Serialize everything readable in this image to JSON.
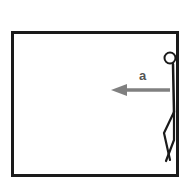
{
  "figure": {
    "background_color": "#ffffff",
    "canvas": {
      "width": 192,
      "height": 188
    }
  },
  "box": {
    "name": "enclosure",
    "stroke_color": "#1a1a1a",
    "fill_color": "#ffffff",
    "stroke_width": 3,
    "x": 12,
    "y": 32,
    "width": 165,
    "height": 143
  },
  "person": {
    "name": "stick-figure",
    "stroke_color": "#1a1a1a",
    "head": {
      "cx": 170,
      "cy": 58,
      "r": 5.5,
      "stroke_width": 2
    },
    "body": {
      "x1": 173,
      "y1": 64,
      "x2": 174,
      "y2": 112,
      "stroke_width": 2.5
    },
    "leg_front": "M 174 112 L 164 133 L 170 160",
    "leg_back": "M 174 112 L 174 140 L 166 161",
    "leg_stroke_width": 2.2
  },
  "arrow": {
    "name": "acceleration-arrow",
    "label": "a",
    "label_color": "#555555",
    "color": "#808080",
    "direction": "left",
    "tip_x": 111,
    "tail_x": 170,
    "y": 90,
    "shaft_thickness": 3.5,
    "head_length": 16,
    "head_half_height": 6
  }
}
